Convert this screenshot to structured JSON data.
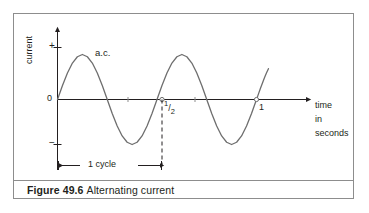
{
  "figure": {
    "caption_label": "Figure 49.6",
    "caption_text": "Alternating current",
    "frame_color": "#8d8d8d",
    "ink_color": "#231f20",
    "curve_color": "#6e6e6e"
  },
  "axes": {
    "y_axis_label": "current",
    "y_tick_plus": "+",
    "y_tick_zero": "0",
    "y_tick_minus": "−",
    "x_axis_label_line1": "time",
    "x_axis_label_line2": "in",
    "x_axis_label_line3": "seconds",
    "x_tick_half_whole": "",
    "x_tick_half_num": "1",
    "x_tick_half_slash": "/",
    "x_tick_half_den": "2",
    "x_tick_one": "1"
  },
  "annotations": {
    "curve_label": "a.c.",
    "cycle_label": "1 cycle"
  },
  "chart_data": {
    "type": "line",
    "title": "Alternating current",
    "xlabel": "time in seconds",
    "ylabel": "current",
    "xlim": [
      0,
      1.2
    ],
    "ylim": [
      -1.2,
      1.2
    ],
    "grid": false,
    "legend": "none",
    "series": [
      {
        "name": "a.c.",
        "description": "sinusoidal alternating current, 2 Hz (period 0.5 s)",
        "equation": "i = I_max * sin(2*pi*t/0.5)",
        "amplitude": 1.0,
        "period_seconds": 0.5,
        "x": [
          0.0,
          0.025,
          0.05,
          0.075,
          0.1,
          0.125,
          0.15,
          0.175,
          0.2,
          0.225,
          0.25,
          0.275,
          0.3,
          0.325,
          0.35,
          0.375,
          0.4,
          0.425,
          0.45,
          0.475,
          0.5,
          0.525,
          0.55,
          0.575,
          0.6,
          0.625,
          0.65,
          0.675,
          0.7,
          0.725,
          0.75,
          0.775,
          0.8,
          0.825,
          0.85,
          0.875,
          0.9,
          0.925,
          0.95,
          0.975,
          1.0
        ],
        "y": [
          0.0,
          0.31,
          0.59,
          0.81,
          0.95,
          1.0,
          0.95,
          0.81,
          0.59,
          0.31,
          0.0,
          -0.31,
          -0.59,
          -0.81,
          -0.95,
          -1.0,
          -0.95,
          -0.81,
          -0.59,
          -0.31,
          0.0,
          0.31,
          0.59,
          0.81,
          0.95,
          1.0,
          0.95,
          0.81,
          0.59,
          0.31,
          0.0,
          -0.31,
          -0.59,
          -0.81,
          -0.95,
          -1.0,
          -0.95,
          -0.81,
          -0.59,
          -0.31,
          0.0
        ]
      }
    ],
    "x_ticks": [
      {
        "value": 0.5,
        "label": "1/2",
        "marked": true
      },
      {
        "value": 1.0,
        "label": "1",
        "marked": true
      }
    ],
    "y_ticks": [
      {
        "value": 1.0,
        "label": "+"
      },
      {
        "value": 0.0,
        "label": "0"
      },
      {
        "value": -1.0,
        "label": "−"
      }
    ],
    "annotations": [
      {
        "text": "a.c.",
        "x": 0.21,
        "y": 0.78,
        "kind": "series-label"
      },
      {
        "text": "1 cycle",
        "x": 0.25,
        "y": -1.35,
        "kind": "span-measure",
        "span_from": 0.0,
        "span_to": 0.5
      },
      {
        "kind": "dashed-drop-line",
        "x": 0.5,
        "from_y": 0.0,
        "to_y": -1.4
      }
    ]
  }
}
